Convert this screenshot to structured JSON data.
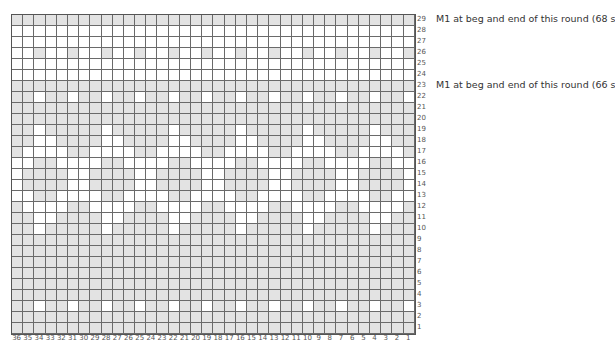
{
  "chart": {
    "columns": 36,
    "rows": 29,
    "colors": {
      "shaded": "#e3e3e3",
      "empty": "#ffffff",
      "gridline": "#6a6a6a"
    },
    "column_labels": [
      "36",
      "35",
      "34",
      "33",
      "32",
      "31",
      "30",
      "29",
      "28",
      "27",
      "26",
      "25",
      "24",
      "23",
      "22",
      "21",
      "20",
      "19",
      "18",
      "17",
      "16",
      "15",
      "14",
      "13",
      "12",
      "11",
      "10",
      "9",
      "8",
      "7",
      "6",
      "5",
      "4",
      "3",
      "2",
      "1"
    ],
    "row_labels": [
      "29",
      "28",
      "27",
      "26",
      "25",
      "24",
      "23",
      "22",
      "21",
      "20",
      "19",
      "18",
      "17",
      "16",
      "15",
      "14",
      "13",
      "12",
      "11",
      "10",
      "9",
      "8",
      "7",
      "6",
      "5",
      "4",
      "3",
      "2",
      "1"
    ],
    "pattern_rows_top_to_bottom": [
      "111111111111111111111111111111111111",
      "000000000000000000000000000000000000",
      "000000000000000000000000000000000000",
      "001001001001001001001001001001001001",
      "000000000000000000000000000000000000",
      "000000000000000000000000000000000000",
      "111111111111111111111111111111111111",
      "110110110110110110110110110110110110",
      "111111111111111111111111111111111111",
      "111111111111111111111111111111111111",
      "110111110111110111110111110111110111",
      "110011110011110011110011110011110011",
      "100001100001100001100001100001100001",
      "001100001100001100001100001100001100",
      "011110011110011110011110011110011110",
      "011110011110011110011110011110011110",
      "001100001100001100001100001100001100",
      "100001100001100001100001100001100001",
      "110011110011110011110011110011110011",
      "110111110111110111110111110111110111",
      "111111111111111111111111111111111111",
      "111111111111111111111111111111111111",
      "111111111111111111111111111111111111",
      "111111111111111111111111111111111111",
      "111111111111111111111111111111111111",
      "111111111111111111111111111111111111",
      "110110110110110110110110110110110110",
      "111111111111111111111111111111111111",
      "111111111111111111111111111111111111"
    ]
  },
  "notes": [
    {
      "row": "29",
      "text": "M1 at beg and end of this round (68 s"
    },
    {
      "row": "23",
      "text": "M1 at beg and end of this round (66 s"
    }
  ]
}
